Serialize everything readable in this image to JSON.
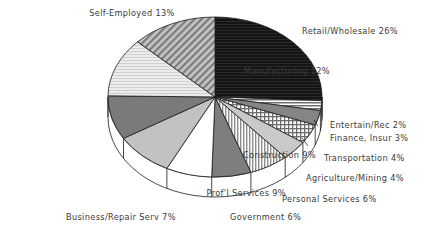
{
  "chart_data": {
    "type": "pie",
    "title": "",
    "subtitle": "",
    "xlabel": "",
    "ylabel": "",
    "legend_position": "labels-around-pie",
    "grid": false,
    "three_d": true,
    "units": "percent",
    "total": 101,
    "start_angle_deg": 0,
    "direction": "clockwise",
    "categories": [
      "Retail/Wholesale",
      "Entertain/Rec",
      "Finance, Insur",
      "Transportation",
      "Agriculture/Mining",
      "Personal Services",
      "Government",
      "Business/Repair Serv",
      "Prof'l Services",
      "Construction",
      "Manufacturing",
      "Self-Employed"
    ],
    "values": [
      26,
      2,
      3,
      4,
      4,
      6,
      6,
      7,
      9,
      9,
      12,
      13
    ],
    "slices": [
      {
        "label": "Retail/Wholesale 26%",
        "name": "Retail/Wholesale",
        "value": 26,
        "pattern": "solid-black",
        "color": "#111111"
      },
      {
        "label": "Entertain/Rec 2%",
        "name": "Entertain/Rec",
        "value": 2,
        "pattern": "horizontal-lines",
        "color": "#8a8a8a"
      },
      {
        "label": "Finance, Insur 3%",
        "name": "Finance, Insur",
        "value": 3,
        "pattern": "solid-gray",
        "color": "#858585"
      },
      {
        "label": "Transportation 4%",
        "name": "Transportation",
        "value": 4,
        "pattern": "cross-hatch",
        "color": "#9a9a9a"
      },
      {
        "label": "Agriculture/Mining 4%",
        "name": "Agriculture/Mining",
        "value": 4,
        "pattern": "light-gray",
        "color": "#c9c9c9"
      },
      {
        "label": "Personal Services 6%",
        "name": "Personal Services",
        "value": 6,
        "pattern": "vertical-lines",
        "color": "#b5b5b5"
      },
      {
        "label": "Government 6%",
        "name": "Government",
        "value": 6,
        "pattern": "solid-midgray",
        "color": "#7e7e7e"
      },
      {
        "label": "Business/Repair Serv 7%",
        "name": "Business/Repair Serv",
        "value": 7,
        "pattern": "white",
        "color": "#ffffff"
      },
      {
        "label": "Prof'l Services 9%",
        "name": "Prof'l Services",
        "value": 9,
        "pattern": "light-gray-2",
        "color": "#c2c2c2"
      },
      {
        "label": "Construction 9%",
        "name": "Construction",
        "value": 9,
        "pattern": "dark-gray",
        "color": "#7a7a7a"
      },
      {
        "label": "Manufacturing 12%",
        "name": "Manufacturing",
        "value": 12,
        "pattern": "very-light-gray",
        "color": "#dedede"
      },
      {
        "label": "Self-Employed 13%",
        "name": "Self-Employed",
        "value": 13,
        "pattern": "diagonal-hatch",
        "color": "#9f9f9f"
      }
    ]
  },
  "style": {
    "outline": "#1a1a1a",
    "text": "#3b3b3b",
    "background": "#ffffff",
    "side_wall": "#ffffff"
  }
}
